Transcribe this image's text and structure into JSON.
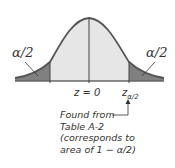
{
  "diagram": {
    "left_tail_label": "α/2",
    "right_tail_label": "α/2",
    "center_label": "z = 0",
    "critical_label_base": "z",
    "critical_label_sub": "α/2",
    "annotation_lines": [
      "Found from",
      "Table A-2",
      "(corresponds to",
      "area of 1 − α/2)"
    ],
    "colors": {
      "curve": "#555555",
      "center_fill": "#e6e6e6",
      "tail_fill": "#808080",
      "baseline": "#666666"
    }
  }
}
